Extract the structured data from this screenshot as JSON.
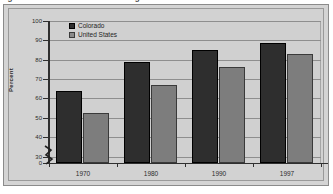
{
  "figure": {
    "title_fragment": "Figure 3.  Health insurance coverage",
    "frame_label": "chart-frame"
  },
  "chart_data": {
    "type": "bar",
    "title": "",
    "xlabel": "",
    "ylabel": "Percent",
    "categories": [
      "1970",
      "1980",
      "1990",
      "1997"
    ],
    "series": [
      {
        "name": "Colorado",
        "color": "#2e2e2e",
        "values": [
          64,
          79,
          85,
          88.5
        ]
      },
      {
        "name": "United States",
        "color": "#7d7d7d",
        "values": [
          52.5,
          67,
          76,
          83
        ]
      }
    ],
    "ylim": [
      0,
      100
    ],
    "yticks": [
      0,
      30,
      40,
      50,
      60,
      70,
      80,
      90,
      100
    ],
    "ytick_labels": [
      "0",
      "30",
      "40",
      "50",
      "60",
      "70",
      "80",
      "90",
      "100"
    ],
    "axis_break": true,
    "axis_break_between": [
      0,
      30
    ],
    "grid": true,
    "grid_axis": "y",
    "legend_position": "top-left"
  },
  "legend": {
    "entries": [
      {
        "label": "Colorado"
      },
      {
        "label": "United States"
      }
    ]
  },
  "colors": {
    "series_0": "#2e2e2e",
    "series_1": "#7d7d7d",
    "plot_background": "#d0d0d0",
    "panel_background": "#d4d4d4",
    "grid": "#8e8e8e",
    "axis": "#2f2f2f"
  }
}
